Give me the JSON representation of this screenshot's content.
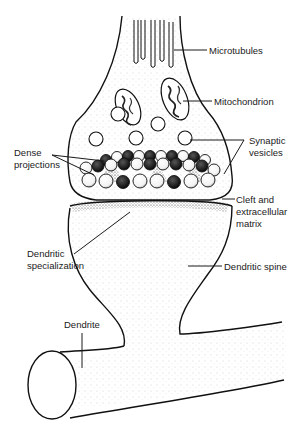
{
  "diagram": {
    "title": "",
    "labels": {
      "microtubules": "Microtubules",
      "mitochondrion": "Mitochondrion",
      "synaptic_vesicles_1": "Synaptic",
      "synaptic_vesicles_2": "vesicles",
      "dense_projections_1": "Dense",
      "dense_projections_2": "projections",
      "cleft_1": "Cleft and",
      "cleft_2": "extracellular",
      "cleft_3": "matrix",
      "dendritic_specialization_1": "Dendritic",
      "dendritic_specialization_2": "specialization",
      "dendritic_spine": "Dendritic spine",
      "dendrite": "Dendrite"
    },
    "colors": {
      "ink": "#111111",
      "background": "#ffffff",
      "stipple": "#9a9a9a",
      "dense": "#1a1a1a"
    }
  }
}
